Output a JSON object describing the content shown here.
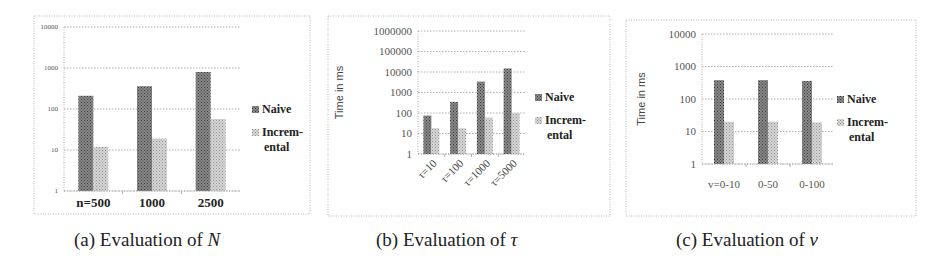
{
  "colors": {
    "naive": "#6e6e6e",
    "incremental": "#bdbdbd",
    "grid": "#9a9a9a",
    "frame": "#b8b8b8",
    "text": "#333333"
  },
  "legend": {
    "naive": "Naive",
    "incremental_line1": "Increm-",
    "incremental_line2": "ental"
  },
  "captions": [
    {
      "prefix": "(a) Evaluation of ",
      "var": "N"
    },
    {
      "prefix": "(b) Evaluation of ",
      "var": "τ"
    },
    {
      "prefix": "(c) Evaluation of ",
      "var": "v"
    }
  ],
  "chart_data": [
    {
      "type": "bar",
      "title": "(a) Evaluation of N",
      "xlabel": "",
      "ylabel": "",
      "yscale": "log",
      "ylim": [
        1,
        10000
      ],
      "yticks": [
        "1",
        "10",
        "100",
        "1000",
        "10000"
      ],
      "categories": [
        "n=500",
        "1000",
        "2500"
      ],
      "series": [
        {
          "name": "Naive",
          "values": [
            210,
            360,
            800
          ]
        },
        {
          "name": "Incremental",
          "values": [
            12,
            19,
            57
          ]
        }
      ],
      "legend_position": "right",
      "grid": true
    },
    {
      "type": "bar",
      "title": "(b) Evaluation of τ",
      "xlabel": "",
      "ylabel": "Time in ms",
      "yscale": "log",
      "ylim": [
        1,
        1000000
      ],
      "yticks": [
        "1",
        "10",
        "100",
        "1000",
        "10000",
        "100000",
        "1000000"
      ],
      "categories": [
        "τ=10",
        "τ=100",
        "τ=1000",
        "τ=5000"
      ],
      "series": [
        {
          "name": "Naive",
          "values": [
            75,
            350,
            3400,
            15000
          ]
        },
        {
          "name": "Incremental",
          "values": [
            18,
            18,
            60,
            100
          ]
        }
      ],
      "legend_position": "right",
      "grid": true
    },
    {
      "type": "bar",
      "title": "(c) Evaluation of v",
      "xlabel": "",
      "ylabel": "Time in ms",
      "yscale": "log",
      "ylim": [
        1,
        10000
      ],
      "yticks": [
        "1",
        "10",
        "100",
        "1000",
        "10000"
      ],
      "categories": [
        "v=0-10",
        "0-50",
        "0-100"
      ],
      "series": [
        {
          "name": "Naive",
          "values": [
            380,
            380,
            360
          ]
        },
        {
          "name": "Incremental",
          "values": [
            20,
            20,
            19
          ]
        }
      ],
      "legend_position": "right",
      "grid": true
    }
  ],
  "layout": [
    {
      "frame": [
        34,
        16,
        276,
        198
      ],
      "plot": {
        "x0": 64,
        "x1": 240,
        "yTop": 27,
        "yBottom": 191
      },
      "barW": 15,
      "groupW": 58,
      "tickFont": 7,
      "catFont": 13,
      "catBold": true,
      "catRotate": false,
      "ylabel": false,
      "legend": {
        "x": 252,
        "y": 113
      }
    },
    {
      "frame": [
        328,
        16,
        282,
        200
      ],
      "plot": {
        "x0": 418,
        "x1": 525,
        "yTop": 31,
        "yBottom": 154
      },
      "barW": 8,
      "groupW": 25,
      "tickFont": 11,
      "catFont": 11,
      "catBold": false,
      "catRotate": true,
      "ylabel": true,
      "ylabelX": 343,
      "legend": {
        "x": 535,
        "y": 101
      }
    },
    {
      "frame": [
        626,
        20,
        290,
        196
      ],
      "plot": {
        "x0": 702,
        "x1": 834,
        "yTop": 34,
        "yBottom": 164
      },
      "barW": 10,
      "groupW": 36,
      "tickFont": 11,
      "catFont": 11,
      "catBold": false,
      "catRotate": false,
      "ylabel": true,
      "ylabelX": 645,
      "legend": {
        "x": 837,
        "y": 103
      }
    }
  ]
}
